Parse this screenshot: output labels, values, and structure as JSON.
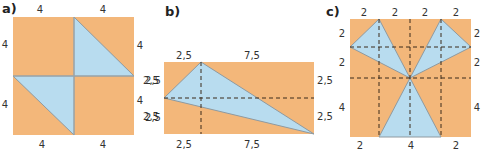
{
  "figures": [
    {
      "label": "a)",
      "top_labels": [
        "4",
        "4"
      ],
      "left_labels": [
        "4",
        "4"
      ],
      "right_labels": [
        "4",
        "2,5",
        "4",
        "2,5"
      ],
      "bottom_labels": [
        "4",
        "4"
      ]
    },
    {
      "label": "b)",
      "top_labels": [
        "2,5",
        "7,5"
      ],
      "left_labels": [
        "2,5",
        "2,5"
      ],
      "right_labels": [
        "2,5",
        "2,5"
      ],
      "bottom_labels": [
        "2,5",
        "7,5"
      ]
    },
    {
      "label": "c)",
      "top_labels": [
        "2",
        "2",
        "2",
        "2"
      ],
      "left_labels": [
        "2",
        "2",
        "4"
      ],
      "right_labels": [
        "2",
        "2",
        "4"
      ],
      "bottom_labels": [
        "2",
        "4",
        "2"
      ]
    }
  ],
  "colors": {
    "background_fill": "#f3b77a",
    "triangle_fill": "#b8dcef",
    "dashed_line": "#3a2a1a"
  }
}
